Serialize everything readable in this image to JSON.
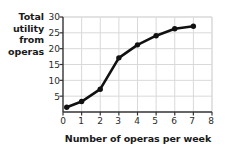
{
  "chart_data": {
    "type": "line",
    "title": "",
    "xlabel": "Number of operas per week",
    "ylabel": "Total utility from operas",
    "ylabel_lines": [
      "Total",
      "utility",
      "from",
      "operas"
    ],
    "x": [
      0.2,
      1,
      2,
      3,
      4,
      5,
      6,
      7
    ],
    "values": [
      1.5,
      3.3,
      7.2,
      17.1,
      21.2,
      24.1,
      26.3,
      27.1
    ],
    "series": [
      {
        "name": "Total utility from operas",
        "values": [
          1.5,
          3.3,
          7.2,
          17.1,
          21.2,
          24.1,
          26.3,
          27.1
        ]
      }
    ],
    "xlim": [
      0,
      8
    ],
    "ylim": [
      0,
      30
    ],
    "xticks": [
      0,
      1,
      2,
      3,
      4,
      5,
      6,
      7,
      8
    ],
    "xtick_labels": [
      "0",
      "1",
      "2",
      "3",
      "4",
      "5",
      "6",
      "7",
      "8"
    ],
    "yticks": [
      5,
      10,
      15,
      20,
      25,
      30
    ],
    "ytick_labels": [
      "5",
      "10",
      "15",
      "20",
      "25",
      "30"
    ],
    "grid": true,
    "grid_color": "#d9d9d9",
    "legend": "none",
    "line_color": "#111111",
    "marker": "circle",
    "marker_color": "#111111",
    "background": "#ffffff"
  }
}
